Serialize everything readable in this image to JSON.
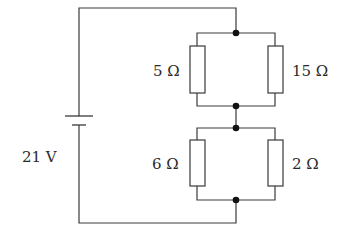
{
  "diagram": {
    "type": "circuit",
    "source": {
      "label": "21 V",
      "voltage": 21,
      "unit": "V"
    },
    "upper_pair": {
      "left": {
        "label": "5 Ω",
        "resistance": 5
      },
      "right": {
        "label": "15 Ω",
        "resistance": 15
      }
    },
    "lower_pair": {
      "left": {
        "label": "6 Ω",
        "resistance": 6
      },
      "right": {
        "label": "2 Ω",
        "resistance": 2
      }
    },
    "colors": {
      "wire": "#3a3a3a",
      "node": "#111111",
      "background": "#ffffff"
    }
  }
}
